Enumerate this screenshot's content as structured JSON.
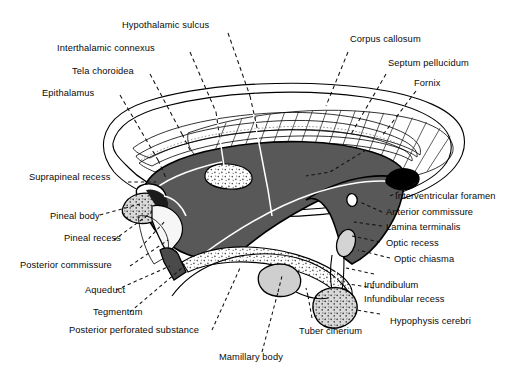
{
  "figure": {
    "background_color": "#ffffff",
    "colors": {
      "ventricle_dark_gray": "#585858",
      "pale_gray": "#e9e9e9",
      "mid_gray": "#c9c9c9",
      "light_gray": "#d6d6d6",
      "stipple_gray": "#cfcfcf",
      "outline_black": "#000000",
      "leader_line": "#111111",
      "white_leader": "#ffffff"
    }
  },
  "labels": {
    "top_left": [
      {
        "id": "hypothalamic-sulcus",
        "text": "Hypothalamic sulcus"
      },
      {
        "id": "interthalamic-connexus",
        "text": "Interthalamic connexus"
      },
      {
        "id": "tela-choroidea",
        "text": "Tela choroidea"
      },
      {
        "id": "epithalamus",
        "text": "Epithalamus"
      }
    ],
    "top_right": [
      {
        "id": "corpus-callosum",
        "text": "Corpus callosum"
      },
      {
        "id": "septum-pellucidum",
        "text": "Septum pellucidum"
      },
      {
        "id": "fornix",
        "text": "Fornix"
      }
    ],
    "left": [
      {
        "id": "suprapineal-recess",
        "text": "Suprapineal recess"
      },
      {
        "id": "pineal-body",
        "text": "Pineal body"
      },
      {
        "id": "pineal-recess",
        "text": "Pineal recess"
      },
      {
        "id": "posterior-commissure",
        "text": "Posterior commissure"
      },
      {
        "id": "aqueduct",
        "text": "Aqueduct"
      },
      {
        "id": "tegmentum",
        "text": "Tegmentum"
      },
      {
        "id": "posterior-perforated-substance",
        "text": "Posterior perforated substance"
      }
    ],
    "right": [
      {
        "id": "interventricular-foramen",
        "text": "Interventricular foramen"
      },
      {
        "id": "anterior-commissure",
        "text": "Anterior commissure"
      },
      {
        "id": "lamina-terminalis",
        "text": "Lamina terminalis"
      },
      {
        "id": "optic-recess",
        "text": "Optic recess"
      },
      {
        "id": "optic-chiasma",
        "text": "Optic chiasma"
      },
      {
        "id": "infundibulum",
        "text": "Infundibulum"
      },
      {
        "id": "infundibular-recess",
        "text": "Infundibular recess"
      },
      {
        "id": "hypophysis-cerebri",
        "text": "Hypophysis cerebri"
      }
    ],
    "bottom": [
      {
        "id": "mamillary-body",
        "text": "Mamillary body"
      },
      {
        "id": "tuber-cinerium",
        "text": "Tuber cinerium"
      }
    ]
  }
}
